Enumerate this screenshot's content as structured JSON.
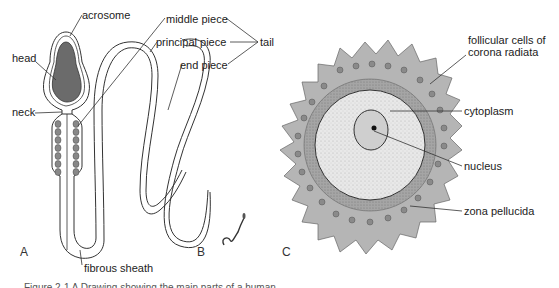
{
  "figure": {
    "panel_labels": {
      "a": "A",
      "b": "B",
      "c": "C"
    },
    "sperm_labels": {
      "acrosome": "acrosome",
      "head": "head",
      "neck": "neck",
      "middle_piece": "middle piece",
      "principal_piece": "principal piece",
      "end_piece": "end piece",
      "tail": "tail",
      "fibrous_sheath": "fibrous sheath"
    },
    "oocyte_labels": {
      "follicular_cells_line1": "follicular cells of",
      "follicular_cells_line2": "corona radiata",
      "cytoplasm": "cytoplasm",
      "nucleus": "nucleus",
      "zona_pellucida": "zona pellucida"
    },
    "caption": "Figure 2-1 A Drawing showing the main parts of a human",
    "colors": {
      "head_fill": "#6b6b6b",
      "corona_fill": "#b5b5b5",
      "zona_fill": "#9a9a9a",
      "cytoplasm_fill": "#e4e4e4",
      "nucleus_fill": "#cfcfcf",
      "outline": "#333333"
    }
  }
}
